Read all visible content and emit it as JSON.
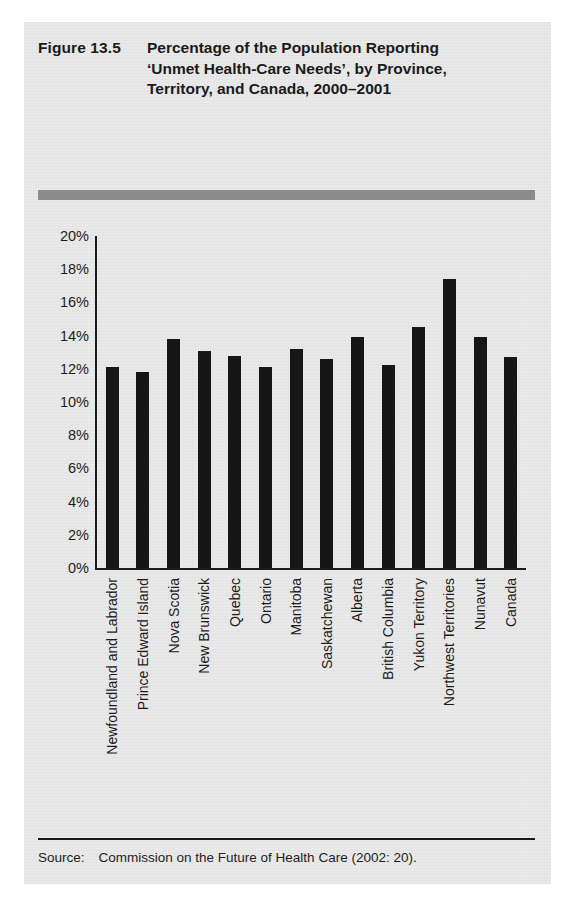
{
  "figure": {
    "number_label": "Figure 13.5",
    "title": "Percentage of the Population Reporting ‘Unmet Health-Care Needs’, by Province, Territory, and Canada, 2000–2001"
  },
  "source": {
    "label": "Source:",
    "text": "Commission on the Future of Health Care (2002: 20)."
  },
  "colors": {
    "bar": "#161616",
    "rule_bar": "#8c8c8c",
    "paper": "#e9e9e9",
    "axis": "#1a1a1a",
    "text": "#1e1e1e"
  },
  "chart_data": {
    "type": "bar",
    "title": "Percentage of the Population Reporting ‘Unmet Health-Care Needs’, by Province, Territory, and Canada, 2000–2001",
    "xlabel": "",
    "ylabel": "",
    "ylim": [
      0,
      20
    ],
    "ytick_step": 2,
    "ytick_labels": [
      "20%",
      "18%",
      "16%",
      "14%",
      "12%",
      "10%",
      "8%",
      "6%",
      "4%",
      "2%",
      "0%"
    ],
    "ytick_values": [
      20,
      18,
      16,
      14,
      12,
      10,
      8,
      6,
      4,
      2,
      0
    ],
    "grid": false,
    "legend": false,
    "value_suffix": "%",
    "categories": [
      "Newfoundland and Labrador",
      "Prince Edward Island",
      "Nova Scotia",
      "New Brunswick",
      "Quebec",
      "Ontario",
      "Manitoba",
      "Saskatchewan",
      "Alberta",
      "British Columbia",
      "Yukon Territory",
      "Northwest Territories",
      "Nunavut",
      "Canada"
    ],
    "values": [
      12.1,
      11.8,
      13.8,
      13.1,
      12.8,
      12.1,
      13.2,
      12.6,
      13.9,
      12.2,
      14.5,
      17.4,
      13.9,
      12.7
    ]
  }
}
